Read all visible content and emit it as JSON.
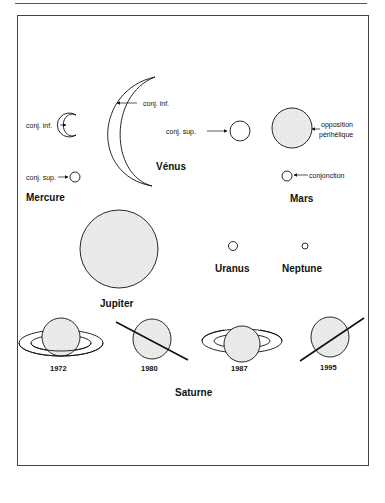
{
  "diagram": {
    "mercure": {
      "name": "Mercure",
      "label_inf": "conj. inf.",
      "label_sup": "conj. sup."
    },
    "venus": {
      "name": "Vénus",
      "label_inf": "conj. inf.",
      "label_sup": "conj. sup."
    },
    "mars": {
      "name": "Mars",
      "label_opp_line1": "opposition",
      "label_opp_line2": "périhélique",
      "label_conj": "conjonction"
    },
    "jupiter": {
      "name": "Jupiter"
    },
    "uranus": {
      "name": "Uranus"
    },
    "neptune": {
      "name": "Neptune"
    },
    "saturne": {
      "name": "Saturne",
      "years": [
        "1972",
        "1980",
        "1987",
        "1995"
      ]
    }
  },
  "colors": {
    "stroke": "#111111",
    "disk_fill": "#e6e6e6",
    "background": "#ffffff"
  }
}
